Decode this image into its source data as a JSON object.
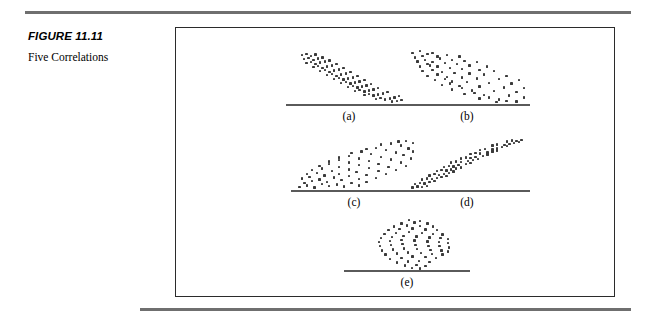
{
  "caption": {
    "figure_number": "FIGURE 11.11",
    "title": "Five Correlations"
  },
  "colors": {
    "rule": "#6f6f6f",
    "frame_border": "#2b2b2b",
    "dot": "#3a3a3a",
    "axis": "#5a5a5a",
    "background": "#ffffff",
    "text": "#000000"
  },
  "figure": {
    "panels": [
      {
        "label": "(a)"
      },
      {
        "label": "(b)"
      },
      {
        "label": "(c)"
      },
      {
        "label": "(d)"
      },
      {
        "label": "(e)"
      }
    ]
  },
  "chart_data": [
    {
      "type": "scatter",
      "title": "(a)",
      "description": "strong negative correlation",
      "direction": "negative",
      "strength": "strong",
      "xlabel": "",
      "ylabel": "",
      "xlim": [
        0,
        100
      ],
      "ylim": [
        0,
        100
      ],
      "grid": false,
      "axis": "baseline-only",
      "points": [
        [
          6,
          86
        ],
        [
          10,
          88
        ],
        [
          14,
          85
        ],
        [
          18,
          87
        ],
        [
          8,
          79
        ],
        [
          12,
          81
        ],
        [
          16,
          78
        ],
        [
          20,
          80
        ],
        [
          24,
          82
        ],
        [
          10,
          72
        ],
        [
          14,
          74
        ],
        [
          18,
          71
        ],
        [
          22,
          73
        ],
        [
          26,
          75
        ],
        [
          30,
          77
        ],
        [
          16,
          65
        ],
        [
          20,
          67
        ],
        [
          24,
          64
        ],
        [
          28,
          66
        ],
        [
          32,
          68
        ],
        [
          36,
          70
        ],
        [
          22,
          58
        ],
        [
          26,
          60
        ],
        [
          30,
          57
        ],
        [
          34,
          59
        ],
        [
          38,
          61
        ],
        [
          42,
          63
        ],
        [
          28,
          51
        ],
        [
          32,
          53
        ],
        [
          36,
          50
        ],
        [
          40,
          52
        ],
        [
          44,
          54
        ],
        [
          48,
          56
        ],
        [
          34,
          44
        ],
        [
          38,
          46
        ],
        [
          42,
          43
        ],
        [
          46,
          45
        ],
        [
          50,
          47
        ],
        [
          54,
          49
        ],
        [
          40,
          37
        ],
        [
          44,
          39
        ],
        [
          48,
          36
        ],
        [
          52,
          38
        ],
        [
          56,
          40
        ],
        [
          60,
          42
        ],
        [
          46,
          30
        ],
        [
          50,
          32
        ],
        [
          54,
          29
        ],
        [
          58,
          31
        ],
        [
          62,
          33
        ],
        [
          66,
          35
        ],
        [
          52,
          23
        ],
        [
          56,
          25
        ],
        [
          60,
          22
        ],
        [
          64,
          24
        ],
        [
          68,
          26
        ],
        [
          72,
          28
        ],
        [
          60,
          16
        ],
        [
          64,
          18
        ],
        [
          68,
          15
        ],
        [
          72,
          17
        ],
        [
          76,
          19
        ],
        [
          80,
          21
        ],
        [
          70,
          9
        ],
        [
          74,
          11
        ],
        [
          78,
          8
        ],
        [
          82,
          10
        ],
        [
          86,
          12
        ],
        [
          90,
          14
        ],
        [
          84,
          5
        ],
        [
          88,
          6
        ],
        [
          92,
          7
        ]
      ]
    },
    {
      "type": "scatter",
      "title": "(b)",
      "description": "moderate negative correlation with wider scatter",
      "direction": "negative",
      "strength": "moderate",
      "xlabel": "",
      "ylabel": "",
      "xlim": [
        0,
        100
      ],
      "ylim": [
        0,
        100
      ],
      "grid": false,
      "axis": "baseline-only",
      "points": [
        [
          4,
          90
        ],
        [
          10,
          93
        ],
        [
          16,
          88
        ],
        [
          6,
          82
        ],
        [
          12,
          85
        ],
        [
          20,
          90
        ],
        [
          24,
          84
        ],
        [
          8,
          75
        ],
        [
          14,
          78
        ],
        [
          20,
          74
        ],
        [
          26,
          80
        ],
        [
          32,
          86
        ],
        [
          18,
          68
        ],
        [
          10,
          66
        ],
        [
          16,
          70
        ],
        [
          24,
          66
        ],
        [
          30,
          72
        ],
        [
          36,
          78
        ],
        [
          42,
          84
        ],
        [
          12,
          58
        ],
        [
          20,
          60
        ],
        [
          28,
          57
        ],
        [
          34,
          63
        ],
        [
          40,
          70
        ],
        [
          46,
          76
        ],
        [
          16,
          50
        ],
        [
          24,
          52
        ],
        [
          32,
          48
        ],
        [
          38,
          55
        ],
        [
          44,
          62
        ],
        [
          50,
          68
        ],
        [
          56,
          74
        ],
        [
          22,
          42
        ],
        [
          30,
          44
        ],
        [
          36,
          40
        ],
        [
          44,
          47
        ],
        [
          50,
          54
        ],
        [
          58,
          60
        ],
        [
          64,
          66
        ],
        [
          28,
          34
        ],
        [
          34,
          36
        ],
        [
          42,
          32
        ],
        [
          48,
          39
        ],
        [
          56,
          45
        ],
        [
          62,
          52
        ],
        [
          70,
          58
        ],
        [
          36,
          26
        ],
        [
          44,
          28
        ],
        [
          52,
          24
        ],
        [
          58,
          31
        ],
        [
          66,
          37
        ],
        [
          74,
          44
        ],
        [
          80,
          50
        ],
        [
          46,
          18
        ],
        [
          54,
          20
        ],
        [
          62,
          16
        ],
        [
          70,
          23
        ],
        [
          78,
          29
        ],
        [
          84,
          36
        ],
        [
          90,
          42
        ],
        [
          58,
          10
        ],
        [
          66,
          12
        ],
        [
          74,
          8
        ],
        [
          82,
          15
        ],
        [
          88,
          21
        ],
        [
          94,
          28
        ],
        [
          72,
          4
        ],
        [
          80,
          6
        ],
        [
          88,
          5
        ],
        [
          94,
          12
        ]
      ]
    },
    {
      "type": "scatter",
      "title": "(c)",
      "description": "moderate positive correlation with wider scatter",
      "direction": "positive",
      "strength": "moderate",
      "xlabel": "",
      "ylabel": "",
      "xlim": [
        0,
        100
      ],
      "ylim": [
        0,
        100
      ],
      "grid": false,
      "axis": "baseline-only",
      "points": [
        [
          4,
          6
        ],
        [
          10,
          9
        ],
        [
          16,
          5
        ],
        [
          8,
          14
        ],
        [
          14,
          17
        ],
        [
          22,
          12
        ],
        [
          28,
          8
        ],
        [
          6,
          22
        ],
        [
          12,
          25
        ],
        [
          20,
          20
        ],
        [
          26,
          16
        ],
        [
          34,
          11
        ],
        [
          40,
          7
        ],
        [
          10,
          30
        ],
        [
          18,
          33
        ],
        [
          24,
          28
        ],
        [
          32,
          24
        ],
        [
          38,
          19
        ],
        [
          46,
          14
        ],
        [
          52,
          9
        ],
        [
          14,
          38
        ],
        [
          22,
          41
        ],
        [
          30,
          36
        ],
        [
          36,
          31
        ],
        [
          44,
          27
        ],
        [
          52,
          21
        ],
        [
          58,
          16
        ],
        [
          20,
          46
        ],
        [
          28,
          49
        ],
        [
          36,
          44
        ],
        [
          44,
          39
        ],
        [
          50,
          34
        ],
        [
          58,
          29
        ],
        [
          66,
          23
        ],
        [
          28,
          54
        ],
        [
          36,
          57
        ],
        [
          44,
          52
        ],
        [
          52,
          47
        ],
        [
          60,
          42
        ],
        [
          68,
          36
        ],
        [
          74,
          30
        ],
        [
          36,
          62
        ],
        [
          44,
          65
        ],
        [
          52,
          60
        ],
        [
          60,
          55
        ],
        [
          68,
          50
        ],
        [
          76,
          44
        ],
        [
          82,
          38
        ],
        [
          46,
          70
        ],
        [
          54,
          73
        ],
        [
          62,
          68
        ],
        [
          70,
          63
        ],
        [
          78,
          58
        ],
        [
          86,
          52
        ],
        [
          90,
          46
        ],
        [
          58,
          78
        ],
        [
          66,
          80
        ],
        [
          74,
          76
        ],
        [
          82,
          71
        ],
        [
          88,
          66
        ],
        [
          94,
          60
        ],
        [
          70,
          86
        ],
        [
          78,
          88
        ],
        [
          86,
          84
        ],
        [
          92,
          79
        ],
        [
          96,
          73
        ],
        [
          84,
          92
        ],
        [
          90,
          93
        ],
        [
          96,
          89
        ]
      ]
    },
    {
      "type": "scatter",
      "title": "(d)",
      "description": "strong positive correlation, narrow band",
      "direction": "positive",
      "strength": "strong",
      "xlabel": "",
      "ylabel": "",
      "xlim": [
        0,
        100
      ],
      "ylim": [
        0,
        100
      ],
      "grid": false,
      "axis": "baseline-only",
      "points": [
        [
          4,
          5
        ],
        [
          8,
          7
        ],
        [
          12,
          6
        ],
        [
          16,
          8
        ],
        [
          6,
          12
        ],
        [
          10,
          14
        ],
        [
          14,
          13
        ],
        [
          18,
          15
        ],
        [
          22,
          17
        ],
        [
          12,
          20
        ],
        [
          16,
          22
        ],
        [
          20,
          21
        ],
        [
          24,
          23
        ],
        [
          28,
          25
        ],
        [
          32,
          27
        ],
        [
          18,
          28
        ],
        [
          22,
          30
        ],
        [
          26,
          29
        ],
        [
          30,
          31
        ],
        [
          34,
          33
        ],
        [
          38,
          35
        ],
        [
          24,
          36
        ],
        [
          28,
          38
        ],
        [
          32,
          37
        ],
        [
          36,
          39
        ],
        [
          40,
          41
        ],
        [
          44,
          43
        ],
        [
          30,
          44
        ],
        [
          34,
          46
        ],
        [
          38,
          45
        ],
        [
          42,
          47
        ],
        [
          48,
          49
        ],
        [
          52,
          51
        ],
        [
          36,
          52
        ],
        [
          40,
          54
        ],
        [
          44,
          53
        ],
        [
          50,
          55
        ],
        [
          54,
          57
        ],
        [
          58,
          59
        ],
        [
          44,
          60
        ],
        [
          48,
          62
        ],
        [
          52,
          61
        ],
        [
          56,
          63
        ],
        [
          62,
          65
        ],
        [
          66,
          67
        ],
        [
          52,
          68
        ],
        [
          56,
          70
        ],
        [
          60,
          69
        ],
        [
          66,
          71
        ],
        [
          70,
          73
        ],
        [
          74,
          75
        ],
        [
          60,
          76
        ],
        [
          64,
          78
        ],
        [
          70,
          77
        ],
        [
          74,
          79
        ],
        [
          78,
          81
        ],
        [
          82,
          83
        ],
        [
          70,
          84
        ],
        [
          74,
          86
        ],
        [
          80,
          85
        ],
        [
          84,
          87
        ],
        [
          88,
          89
        ],
        [
          92,
          91
        ],
        [
          82,
          92
        ],
        [
          86,
          94
        ],
        [
          90,
          93
        ],
        [
          94,
          95
        ]
      ]
    },
    {
      "type": "scatter",
      "title": "(e)",
      "description": "no correlation, circular cloud of points",
      "direction": "none",
      "strength": "zero",
      "xlabel": "",
      "ylabel": "",
      "xlim": [
        0,
        100
      ],
      "ylim": [
        0,
        100
      ],
      "grid": false,
      "axis": "baseline-only",
      "points": [
        [
          44,
          96
        ],
        [
          56,
          95
        ],
        [
          36,
          90
        ],
        [
          50,
          92
        ],
        [
          64,
          90
        ],
        [
          28,
          84
        ],
        [
          42,
          86
        ],
        [
          56,
          85
        ],
        [
          70,
          84
        ],
        [
          22,
          77
        ],
        [
          34,
          79
        ],
        [
          48,
          80
        ],
        [
          62,
          78
        ],
        [
          74,
          77
        ],
        [
          18,
          70
        ],
        [
          30,
          72
        ],
        [
          44,
          73
        ],
        [
          58,
          71
        ],
        [
          70,
          70
        ],
        [
          80,
          69
        ],
        [
          14,
          62
        ],
        [
          26,
          64
        ],
        [
          38,
          66
        ],
        [
          52,
          65
        ],
        [
          66,
          63
        ],
        [
          78,
          62
        ],
        [
          86,
          60
        ],
        [
          12,
          54
        ],
        [
          24,
          56
        ],
        [
          36,
          58
        ],
        [
          50,
          57
        ],
        [
          64,
          55
        ],
        [
          76,
          54
        ],
        [
          86,
          52
        ],
        [
          13,
          46
        ],
        [
          25,
          48
        ],
        [
          37,
          50
        ],
        [
          51,
          49
        ],
        [
          65,
          47
        ],
        [
          77,
          46
        ],
        [
          87,
          44
        ],
        [
          15,
          38
        ],
        [
          27,
          40
        ],
        [
          39,
          42
        ],
        [
          53,
          41
        ],
        [
          67,
          39
        ],
        [
          79,
          38
        ],
        [
          86,
          36
        ],
        [
          19,
          30
        ],
        [
          31,
          32
        ],
        [
          43,
          34
        ],
        [
          57,
          33
        ],
        [
          69,
          31
        ],
        [
          80,
          30
        ],
        [
          24,
          22
        ],
        [
          36,
          24
        ],
        [
          48,
          26
        ],
        [
          62,
          25
        ],
        [
          73,
          23
        ],
        [
          31,
          15
        ],
        [
          43,
          17
        ],
        [
          55,
          18
        ],
        [
          66,
          16
        ],
        [
          40,
          9
        ],
        [
          52,
          10
        ],
        [
          62,
          8
        ],
        [
          47,
          4
        ],
        [
          56,
          3
        ]
      ]
    }
  ]
}
